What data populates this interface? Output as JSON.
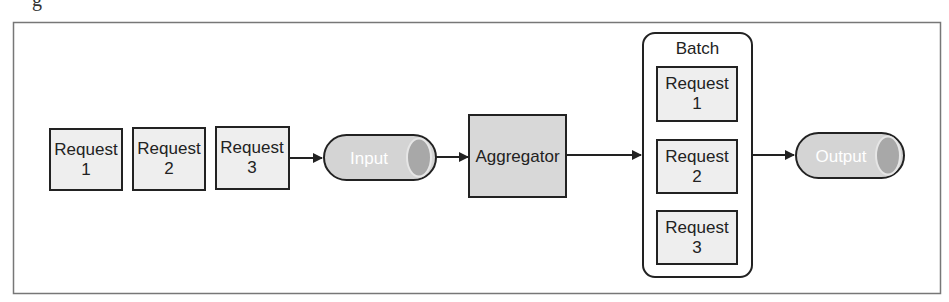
{
  "caption_fragment": "g",
  "colors": {
    "frame": "#777777",
    "stroke": "#222222",
    "box_fill": "#eeeeee",
    "aggregator_fill": "#d8d8d8",
    "cylinder_fill": "#d4d4d4",
    "cylinder_cap": "#a8a8a8"
  },
  "diagram": {
    "queued_requests": [
      {
        "line1": "Request",
        "line2": "1"
      },
      {
        "line1": "Request",
        "line2": "2"
      },
      {
        "line1": "Request",
        "line2": "3"
      }
    ],
    "input": {
      "label": "Input"
    },
    "aggregator": {
      "label": "Aggregator"
    },
    "batch": {
      "title": "Batch",
      "requests": [
        {
          "line1": "Request",
          "line2": "1"
        },
        {
          "line1": "Request",
          "line2": "2"
        },
        {
          "line1": "Request",
          "line2": "3"
        }
      ]
    },
    "output": {
      "label": "Output"
    }
  }
}
